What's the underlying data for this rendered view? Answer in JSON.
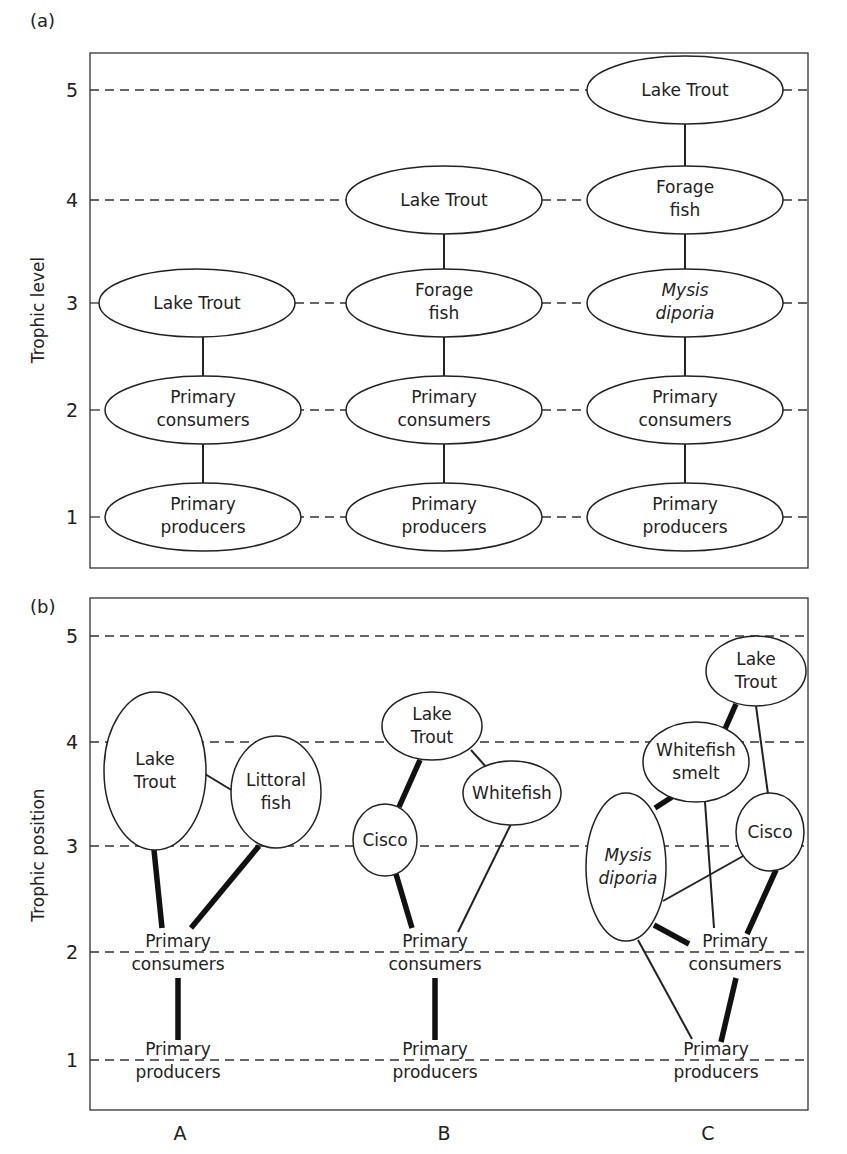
{
  "panels": [
    {
      "id": "a",
      "label": "(a)",
      "y_axis_label": "Trophic level",
      "y_ticks": [
        "1",
        "2",
        "3",
        "4",
        "5"
      ],
      "columns": [
        {
          "id": "A",
          "nodes": [
            {
              "label_lines": [
                "Lake Trout"
              ],
              "level": 3
            },
            {
              "label_lines": [
                "Primary",
                "consumers"
              ],
              "level": 2
            },
            {
              "label_lines": [
                "Primary",
                "producers"
              ],
              "level": 1
            }
          ]
        },
        {
          "id": "B",
          "nodes": [
            {
              "label_lines": [
                "Lake Trout"
              ],
              "level": 4
            },
            {
              "label_lines": [
                "Forage",
                "fish"
              ],
              "level": 3
            },
            {
              "label_lines": [
                "Primary",
                "consumers"
              ],
              "level": 2
            },
            {
              "label_lines": [
                "Primary",
                "producers"
              ],
              "level": 1
            }
          ]
        },
        {
          "id": "C",
          "nodes": [
            {
              "label_lines": [
                "Lake Trout"
              ],
              "level": 5
            },
            {
              "label_lines": [
                "Forage",
                "fish"
              ],
              "level": 4
            },
            {
              "label_lines": [
                "Mysis",
                "diporia"
              ],
              "level": 3,
              "italic": true
            },
            {
              "label_lines": [
                "Primary",
                "consumers"
              ],
              "level": 2
            },
            {
              "label_lines": [
                "Primary",
                "producers"
              ],
              "level": 1
            }
          ]
        }
      ]
    },
    {
      "id": "b",
      "label": "(b)",
      "y_axis_label": "Trophic position",
      "y_ticks": [
        "1",
        "2",
        "3",
        "4",
        "5"
      ],
      "x_labels": [
        "A",
        "B",
        "C"
      ],
      "columns": [
        {
          "id": "A",
          "nodes": [
            {
              "label_lines": [
                "Lake",
                "Trout"
              ],
              "position": 3.7
            },
            {
              "label_lines": [
                "Littoral",
                "fish"
              ],
              "position": 3.5
            },
            {
              "label_lines": [
                "Primary",
                "consumers"
              ],
              "position": 2.0
            },
            {
              "label_lines": [
                "Primary",
                "producers"
              ],
              "position": 1.0
            }
          ],
          "links": [
            {
              "from": "Littoral fish",
              "to": "Lake Trout",
              "strength": "weak"
            },
            {
              "from": "Primary consumers",
              "to": "Lake Trout",
              "strength": "strong"
            },
            {
              "from": "Primary consumers",
              "to": "Littoral fish",
              "strength": "strong"
            },
            {
              "from": "Primary producers",
              "to": "Primary consumers",
              "strength": "strong"
            }
          ]
        },
        {
          "id": "B",
          "nodes": [
            {
              "label_lines": [
                "Lake",
                "Trout"
              ],
              "position": 4.1
            },
            {
              "label_lines": [
                "Whitefish"
              ],
              "position": 3.6
            },
            {
              "label_lines": [
                "Cisco"
              ],
              "position": 3.0
            },
            {
              "label_lines": [
                "Primary",
                "consumers"
              ],
              "position": 2.0
            },
            {
              "label_lines": [
                "Primary",
                "producers"
              ],
              "position": 1.0
            }
          ],
          "links": [
            {
              "from": "Cisco",
              "to": "Lake Trout",
              "strength": "strong"
            },
            {
              "from": "Whitefish",
              "to": "Lake Trout",
              "strength": "weak"
            },
            {
              "from": "Primary consumers",
              "to": "Cisco",
              "strength": "strong"
            },
            {
              "from": "Primary consumers",
              "to": "Whitefish",
              "strength": "weak"
            },
            {
              "from": "Primary producers",
              "to": "Primary consumers",
              "strength": "strong"
            }
          ]
        },
        {
          "id": "C",
          "nodes": [
            {
              "label_lines": [
                "Lake",
                "Trout"
              ],
              "position": 4.7
            },
            {
              "label_lines": [
                "Whitefish",
                "smelt"
              ],
              "position": 3.8
            },
            {
              "label_lines": [
                "Cisco"
              ],
              "position": 3.1
            },
            {
              "label_lines": [
                "Mysis",
                "diporia"
              ],
              "position": 2.8,
              "italic": true
            },
            {
              "label_lines": [
                "Primary",
                "consumers"
              ],
              "position": 2.0
            },
            {
              "label_lines": [
                "Primary",
                "producers"
              ],
              "position": 1.0
            }
          ],
          "links": [
            {
              "from": "Whitefish smelt",
              "to": "Lake Trout",
              "strength": "strong"
            },
            {
              "from": "Cisco",
              "to": "Lake Trout",
              "strength": "weak"
            },
            {
              "from": "Mysis diporia",
              "to": "Whitefish smelt",
              "strength": "strong"
            },
            {
              "from": "Primary consumers",
              "to": "Whitefish smelt",
              "strength": "weak"
            },
            {
              "from": "Mysis diporia",
              "to": "Cisco",
              "strength": "weak"
            },
            {
              "from": "Primary consumers",
              "to": "Cisco",
              "strength": "strong"
            },
            {
              "from": "Primary consumers",
              "to": "Mysis diporia",
              "strength": "strong"
            },
            {
              "from": "Primary producers",
              "to": "Mysis diporia",
              "strength": "weak"
            },
            {
              "from": "Primary producers",
              "to": "Primary consumers",
              "strength": "strong"
            }
          ]
        }
      ]
    }
  ],
  "text": {
    "a_label": "(a)",
    "b_label": "(b)",
    "a_ylabel": "Trophic level",
    "b_ylabel": "Trophic position",
    "ticks": {
      "t1": "1",
      "t2": "2",
      "t3": "3",
      "t4": "4",
      "t5": "5"
    },
    "a": {
      "A_lt": "Lake Trout",
      "pc1": "Primary",
      "pc2": "consumers",
      "pp1": "Primary",
      "pp2": "producers",
      "B_lt": "Lake Trout",
      "ff1": "Forage",
      "ff2": "fish",
      "C_lt": "Lake Trout",
      "my1": "Mysis",
      "my2": "diporia"
    },
    "b": {
      "lake": "Lake",
      "trout": "Trout",
      "lit1": "Littoral",
      "lit2": "fish",
      "whitefish": "Whitefish",
      "smelt": "smelt",
      "cisco": "Cisco",
      "my1": "Mysis",
      "my2": "diporia",
      "pc1": "Primary",
      "pc2": "consumers",
      "pp1": "Primary",
      "pp2": "producers",
      "xA": "A",
      "xB": "B",
      "xC": "C"
    }
  },
  "colors": {
    "ink": "#222222",
    "background": "#ffffff"
  }
}
